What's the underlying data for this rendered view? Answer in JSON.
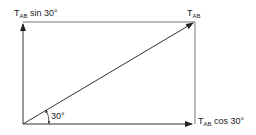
{
  "diagram": {
    "labels": {
      "vertical_component": {
        "main": "T",
        "sub": "AB",
        "suffix": " sin 30°"
      },
      "resultant": {
        "main": "T",
        "sub": "AB"
      },
      "horizontal_component": {
        "main": "T",
        "sub": "AB",
        "suffix": " cos 30°"
      },
      "angle": "30°"
    },
    "colors": {
      "line": "#333333",
      "background": "#ffffff"
    }
  }
}
